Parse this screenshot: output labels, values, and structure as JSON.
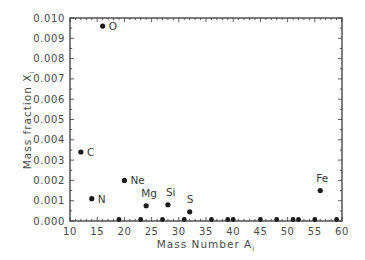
{
  "chart_data": {
    "type": "scatter",
    "title": "",
    "xlabel": "Mass Number A",
    "xlabel_sub": "i",
    "ylabel": "Mass fraction X",
    "ylabel_sub": "i",
    "xlim": [
      10,
      60
    ],
    "ylim": [
      0.0,
      0.01
    ],
    "xticks": [
      10,
      15,
      20,
      25,
      30,
      35,
      40,
      45,
      50,
      55,
      60
    ],
    "xtick_labels": [
      "10",
      "15",
      "20",
      "25",
      "30",
      "35",
      "40",
      "45",
      "50",
      "55",
      "60"
    ],
    "yticks": [
      0.0,
      0.001,
      0.002,
      0.003,
      0.004,
      0.005,
      0.006,
      0.007,
      0.008,
      0.009,
      0.01
    ],
    "ytick_labels": [
      "0.000",
      "0.001",
      "0.002",
      "0.003",
      "0.004",
      "0.005",
      "0.006",
      "0.007",
      "0.008",
      "0.009",
      "0.010"
    ],
    "grid": false,
    "legend": null,
    "series": [
      {
        "name": "Mass fractions",
        "points": [
          {
            "label": "C",
            "x": 12,
            "y": 0.0034
          },
          {
            "label": "N",
            "x": 14,
            "y": 0.0011
          },
          {
            "label": "O",
            "x": 16,
            "y": 0.0096
          },
          {
            "label": "",
            "x": 19,
            "y": 0.0
          },
          {
            "label": "Ne",
            "x": 20,
            "y": 0.002
          },
          {
            "label": "",
            "x": 23,
            "y": 3e-05
          },
          {
            "label": "Mg",
            "x": 24,
            "y": 0.00075
          },
          {
            "label": "",
            "x": 27,
            "y": 6e-05
          },
          {
            "label": "Si",
            "x": 28,
            "y": 0.0008
          },
          {
            "label": "",
            "x": 31,
            "y": 0.0
          },
          {
            "label": "S",
            "x": 32,
            "y": 0.00045
          },
          {
            "label": "",
            "x": 36,
            "y": 0.0
          },
          {
            "label": "",
            "x": 39,
            "y": 0.0
          },
          {
            "label": "",
            "x": 40,
            "y": 7e-05
          },
          {
            "label": "",
            "x": 45,
            "y": 0.0
          },
          {
            "label": "",
            "x": 48,
            "y": 0.0
          },
          {
            "label": "",
            "x": 51,
            "y": 0.0
          },
          {
            "label": "",
            "x": 52,
            "y": 0.0
          },
          {
            "label": "",
            "x": 55,
            "y": 0.0
          },
          {
            "label": "Fe",
            "x": 56,
            "y": 0.0015
          },
          {
            "label": "",
            "x": 59,
            "y": 5e-05
          }
        ]
      }
    ],
    "colors": {
      "axis": "#3a3a3a",
      "marker": "#1a1a1a",
      "text": "#4a4a4a"
    }
  }
}
